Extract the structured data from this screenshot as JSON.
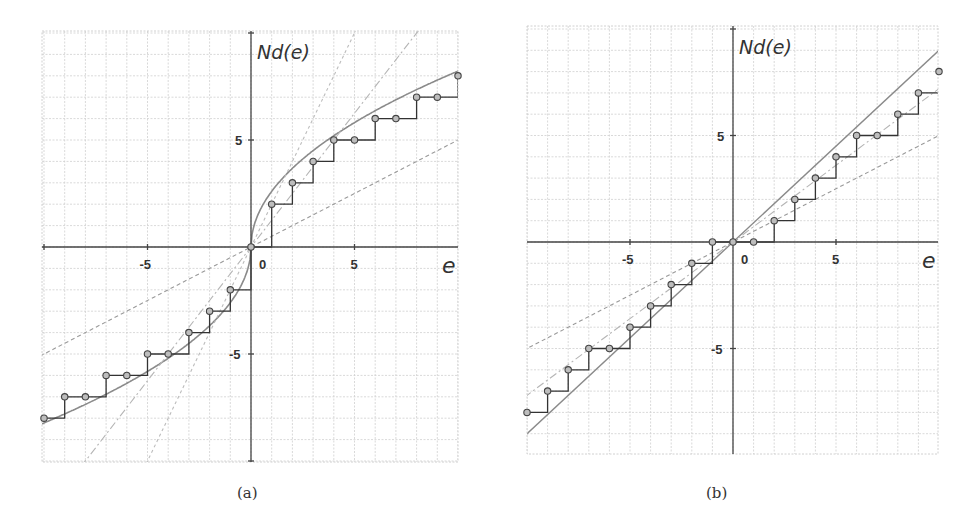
{
  "chart_data": [
    {
      "panel": "(a)",
      "type": "line",
      "title": "",
      "xlabel": "e",
      "ylabel": "Nd(e)",
      "xlim": [
        -10,
        10
      ],
      "ylim": [
        -10,
        10.5
      ],
      "grid": true,
      "x_ticks": [
        {
          "value": -5,
          "label": "-5"
        },
        {
          "value": 0,
          "label": "0"
        },
        {
          "value": 5,
          "label": "5"
        }
      ],
      "y_ticks": [
        {
          "value": 5,
          "label": "5"
        },
        {
          "value": -5,
          "label": "-5"
        }
      ],
      "series": [
        {
          "name": "step-points",
          "style": "step with circles",
          "points": [
            [
              -10,
              -8
            ],
            [
              -9,
              -7
            ],
            [
              -8,
              -7
            ],
            [
              -7,
              -6
            ],
            [
              -6,
              -6
            ],
            [
              -5,
              -5
            ],
            [
              -4,
              -5
            ],
            [
              -3,
              -4
            ],
            [
              -2,
              -3
            ],
            [
              -1,
              -2
            ],
            [
              0,
              0
            ],
            [
              1,
              2
            ],
            [
              2,
              3
            ],
            [
              3,
              4
            ],
            [
              4,
              5
            ],
            [
              5,
              5
            ],
            [
              6,
              6
            ],
            [
              7,
              6
            ],
            [
              8,
              7
            ],
            [
              9,
              7
            ],
            [
              10,
              8
            ]
          ]
        },
        {
          "name": "smooth-curve",
          "style": "solid gray",
          "function": "sign(e)*2.6*sqrt(|e|)"
        },
        {
          "name": "line-slope-2",
          "style": "dashed light",
          "slope": 2
        },
        {
          "name": "line-slope-1.25",
          "style": "dash-dot light",
          "slope": 1.25
        },
        {
          "name": "line-slope-0.5",
          "style": "dashed",
          "slope": 0.5
        }
      ]
    },
    {
      "panel": "(b)",
      "type": "line",
      "title": "",
      "xlabel": "e",
      "ylabel": "Nd(e)",
      "xlim": [
        -10,
        10
      ],
      "ylim": [
        -10,
        10.5
      ],
      "grid": true,
      "x_ticks": [
        {
          "value": -5,
          "label": "-5"
        },
        {
          "value": 0,
          "label": "0"
        },
        {
          "value": 5,
          "label": "5"
        }
      ],
      "y_ticks": [
        {
          "value": 5,
          "label": "5"
        },
        {
          "value": -5,
          "label": "-5"
        }
      ],
      "series": [
        {
          "name": "step-points",
          "style": "step with circles",
          "points": [
            [
              -10,
              -8
            ],
            [
              -9,
              -7
            ],
            [
              -8,
              -6
            ],
            [
              -7,
              -5
            ],
            [
              -6,
              -5
            ],
            [
              -5,
              -4
            ],
            [
              -4,
              -3
            ],
            [
              -3,
              -2
            ],
            [
              -2,
              -1
            ],
            [
              -1,
              0
            ],
            [
              0,
              0
            ],
            [
              1,
              0
            ],
            [
              2,
              1
            ],
            [
              3,
              2
            ],
            [
              4,
              3
            ],
            [
              5,
              4
            ],
            [
              6,
              5
            ],
            [
              7,
              5
            ],
            [
              8,
              6
            ],
            [
              9,
              7
            ],
            [
              10,
              8
            ]
          ]
        },
        {
          "name": "line-slope-0.9",
          "style": "solid gray",
          "slope": 0.9
        },
        {
          "name": "line-slope-0.7",
          "style": "dash-dot light",
          "slope": 0.72
        },
        {
          "name": "line-slope-0.5",
          "style": "dashed",
          "slope": 0.5
        }
      ]
    }
  ],
  "panels": [
    {
      "caption": "(a)",
      "ylabel": "Nd(e)",
      "xlabel": "e",
      "tick_x_neg": "-5",
      "tick_x_zero": "0",
      "tick_x_pos": "5",
      "tick_y_pos": "5",
      "tick_y_neg": "-5"
    },
    {
      "caption": "(b)",
      "ylabel": "Nd(e)",
      "xlabel": "e",
      "tick_x_neg": "-5",
      "tick_x_zero": "0",
      "tick_x_pos": "5",
      "tick_y_pos": "5",
      "tick_y_neg": "-5"
    }
  ]
}
